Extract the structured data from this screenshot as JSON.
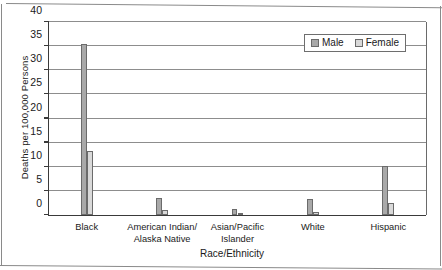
{
  "chart_data": {
    "type": "bar",
    "title": "",
    "xlabel": "Race/Ethnicity",
    "ylabel": "Deaths per 100,000 Persons",
    "categories": [
      "Black",
      "American Indian/\nAlaska Native",
      "Asian/Pacific\nIslander",
      "White",
      "Hispanic"
    ],
    "category_lines": [
      [
        "Black"
      ],
      [
        "American Indian/",
        "Alaska Native"
      ],
      [
        "Asian/Pacific",
        "Islander"
      ],
      [
        "White"
      ],
      [
        "Hispanic"
      ]
    ],
    "series": [
      {
        "name": "Male",
        "color": "#a9a9a9",
        "values": [
          35.3,
          3.3,
          1.0,
          3.2,
          10.0
        ]
      },
      {
        "name": "Female",
        "color": "#d9d9d9",
        "values": [
          13.0,
          0.8,
          0.3,
          0.5,
          2.2
        ]
      }
    ],
    "ylim": [
      0,
      40
    ],
    "ytick_values": [
      0,
      5,
      10,
      15,
      20,
      25,
      30,
      35,
      40
    ],
    "ytick_labels": [
      "0",
      "5",
      "10",
      "15",
      "20",
      "25",
      "30",
      "35",
      "40"
    ],
    "grid": "horizontal",
    "legend_position": "top-right",
    "legend_entries": [
      "Male",
      "Female"
    ]
  }
}
